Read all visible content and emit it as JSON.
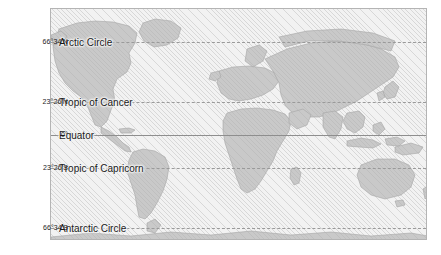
{
  "figure": {
    "type": "world-map",
    "projection_note": "Mercator-style world map",
    "colors": {
      "page_background": "#ffffff",
      "ocean": "#f2f2f2",
      "ocean_hatch": "#b0b0b0",
      "land_fill": "#c9c9c9",
      "land_stroke": "#9f9f9f",
      "frame_border": "#b4b4b4",
      "line_dashed": "#9a9a9a",
      "line_solid": "#8e8e8e",
      "text": "#1a1a1a"
    }
  },
  "latitudes": [
    {
      "id": "arctic-circle",
      "tick": "66°34'N",
      "name": "Arctic Circle",
      "style": "dashed",
      "y_px": 41,
      "degrees": 66.5667,
      "hemisphere": "N"
    },
    {
      "id": "tropic-of-cancer",
      "tick": "23°26'N",
      "name": "Tropic of Cancer",
      "style": "dashed",
      "y_px": 101,
      "degrees": 23.4333,
      "hemisphere": "N"
    },
    {
      "id": "equator",
      "tick": "0°",
      "name": "Equator",
      "style": "solid",
      "y_px": 134,
      "degrees": 0,
      "hemisphere": ""
    },
    {
      "id": "tropic-of-capricorn",
      "tick": "23°26'S",
      "name": "Tropic of Capricorn",
      "style": "dashed",
      "y_px": 167,
      "degrees": -23.4333,
      "hemisphere": "S"
    },
    {
      "id": "antarctic-circle",
      "tick": "66°34'S",
      "name": "Antarctic Circle",
      "style": "dashed",
      "y_px": 227,
      "degrees": -66.5667,
      "hemisphere": "S"
    }
  ]
}
